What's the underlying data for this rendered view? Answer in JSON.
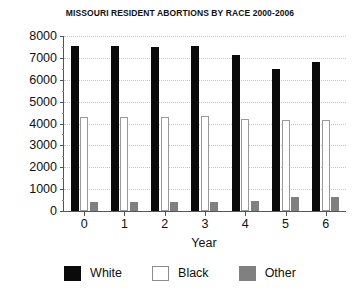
{
  "chart_data": {
    "type": "bar",
    "title": "MISSOURI RESIDENT ABORTIONS BY RACE 2000-2006",
    "xlabel": "Year",
    "ylabel": "",
    "categories": [
      "0",
      "1",
      "2",
      "3",
      "4",
      "5",
      "6"
    ],
    "series": [
      {
        "name": "White",
        "color": "#0a0a0a",
        "values": [
          7550,
          7550,
          7480,
          7530,
          7150,
          6500,
          6800
        ]
      },
      {
        "name": "Black",
        "color": "#ffffff",
        "values": [
          4300,
          4300,
          4320,
          4330,
          4220,
          4180,
          4180
        ]
      },
      {
        "name": "Other",
        "color": "#808080",
        "values": [
          430,
          420,
          430,
          420,
          450,
          620,
          650
        ]
      }
    ],
    "ylim": [
      0,
      8000
    ],
    "ytick_labels": [
      "0",
      "1000",
      "2000",
      "3000",
      "4000",
      "5000",
      "6000",
      "7000",
      "8000"
    ],
    "ytick_values": [
      0,
      1000,
      2000,
      3000,
      4000,
      5000,
      6000,
      7000,
      8000
    ],
    "grid": true,
    "legend_position": "bottom",
    "legend": [
      {
        "label": "White",
        "swatch": "black-filled"
      },
      {
        "label": "Black",
        "swatch": "white-outlined"
      },
      {
        "label": "Other",
        "swatch": "gray-filled"
      }
    ]
  }
}
